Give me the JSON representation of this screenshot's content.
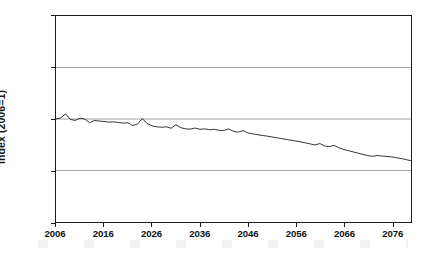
{
  "chart_data": {
    "type": "line",
    "title": "",
    "subtitle": "",
    "xlabel": "",
    "ylabel": "Index (2006=1)",
    "xlim": [
      2006,
      2080
    ],
    "ylim": [
      0.5,
      1.5
    ],
    "grid": true,
    "gridlines_y": [
      0.75,
      1.0,
      1.25
    ],
    "legend": "none",
    "y_ticks": [
      "0.50",
      "0.75",
      "1.00",
      "1.25",
      "1.50"
    ],
    "y_tick_values": [
      0.5,
      0.75,
      1.0,
      1.25,
      1.5
    ],
    "x_ticks": [
      "2006",
      "2016",
      "2026",
      "2036",
      "2046",
      "2056",
      "2066",
      "2076"
    ],
    "x_tick_values": [
      2006,
      2016,
      2026,
      2036,
      2046,
      2056,
      2066,
      2076
    ],
    "line_color": "#1d1d1d",
    "grid_color": "#8d8d8d",
    "background_color": "#ffffff",
    "series": [
      {
        "name": "Index (2006=1)",
        "x": [
          2006,
          2007,
          2008,
          2009,
          2010,
          2011,
          2012,
          2013,
          2014,
          2015,
          2016,
          2017,
          2018,
          2019,
          2020,
          2021,
          2022,
          2023,
          2024,
          2025,
          2026,
          2027,
          2028,
          2029,
          2030,
          2031,
          2032,
          2033,
          2034,
          2035,
          2036,
          2037,
          2038,
          2039,
          2040,
          2041,
          2042,
          2043,
          2044,
          2045,
          2046,
          2047,
          2048,
          2049,
          2050,
          2051,
          2052,
          2053,
          2054,
          2055,
          2056,
          2057,
          2058,
          2059,
          2060,
          2061,
          2062,
          2063,
          2064,
          2065,
          2066,
          2067,
          2068,
          2069,
          2070,
          2071,
          2072,
          2073,
          2074,
          2075,
          2076,
          2077,
          2078,
          2079,
          2080
        ],
        "values": [
          1.0,
          1.005,
          1.025,
          0.998,
          0.993,
          1.004,
          1.0,
          0.982,
          0.993,
          0.99,
          0.988,
          0.985,
          0.986,
          0.983,
          0.98,
          0.982,
          0.968,
          0.976,
          1.002,
          0.978,
          0.967,
          0.962,
          0.96,
          0.962,
          0.955,
          0.972,
          0.958,
          0.952,
          0.951,
          0.956,
          0.95,
          0.952,
          0.948,
          0.95,
          0.945,
          0.944,
          0.952,
          0.94,
          0.936,
          0.944,
          0.932,
          0.928,
          0.924,
          0.92,
          0.917,
          0.913,
          0.909,
          0.905,
          0.901,
          0.897,
          0.893,
          0.889,
          0.884,
          0.879,
          0.874,
          0.881,
          0.869,
          0.866,
          0.872,
          0.86,
          0.852,
          0.846,
          0.84,
          0.834,
          0.828,
          0.822,
          0.819,
          0.823,
          0.82,
          0.818,
          0.816,
          0.812,
          0.808,
          0.803,
          0.797
        ]
      }
    ]
  },
  "axes": {
    "y_title": "Index (2006=1)"
  }
}
